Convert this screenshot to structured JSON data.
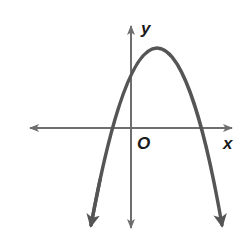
{
  "diagram": {
    "type": "coordinate-plane-parabola",
    "axes": {
      "x_label": "x",
      "y_label": "y",
      "origin_label": "O"
    },
    "curve": {
      "shape": "downward-opening parabola",
      "vertex_quadrant": "I",
      "y_intercept": "positive",
      "roots": [
        "negative",
        "positive"
      ]
    },
    "colors": {
      "axis": "#6e6e6e",
      "curve": "#555555",
      "label": "#1a1a1a",
      "background": "#ffffff"
    }
  }
}
